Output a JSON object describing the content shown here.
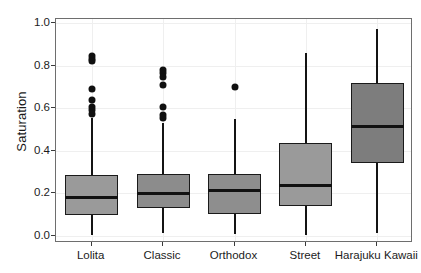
{
  "chart_data": {
    "type": "box",
    "title": "",
    "xlabel": "",
    "ylabel": "Saturation",
    "ylim": [
      0.0,
      1.0
    ],
    "grid": true,
    "legend": "none",
    "categories": [
      "Lolita",
      "Classic",
      "Orthodox",
      "Street",
      "Harajuku Kawaii"
    ],
    "ytick_labels": [
      "1.0",
      "0.8",
      "0.6",
      "0.4",
      "0.2",
      "0.0"
    ],
    "ytick_values": [
      1.0,
      0.8,
      0.6,
      0.4,
      0.2,
      0.0
    ],
    "boxes": [
      {
        "category": "Lolita",
        "whisker_low": 0.005,
        "q1": 0.1,
        "median": 0.18,
        "q3": 0.285,
        "whisker_high": 0.555,
        "fill": "#9a9a9a",
        "outliers": [
          0.845,
          0.83,
          0.82,
          0.69,
          0.64,
          0.605,
          0.59,
          0.575
        ]
      },
      {
        "category": "Classic",
        "whisker_low": 0.015,
        "q1": 0.13,
        "median": 0.2,
        "q3": 0.29,
        "whisker_high": 0.53,
        "fill": "#8c8c8c",
        "outliers": [
          0.78,
          0.765,
          0.745,
          0.71,
          0.605,
          0.57,
          0.555
        ]
      },
      {
        "category": "Orthodox",
        "whisker_low": 0.01,
        "q1": 0.105,
        "median": 0.215,
        "q3": 0.29,
        "whisker_high": 0.55,
        "fill": "#8e8e8e",
        "outliers": [
          0.7
        ]
      },
      {
        "category": "Street",
        "whisker_low": 0.005,
        "q1": 0.14,
        "median": 0.235,
        "q3": 0.435,
        "whisker_high": 0.86,
        "fill": "#9a9a9a",
        "outliers": []
      },
      {
        "category": "Harajuku Kawaii",
        "whisker_low": 0.015,
        "q1": 0.345,
        "median": 0.515,
        "q3": 0.72,
        "whisker_high": 0.97,
        "fill": "#7d7d7d",
        "outliers": []
      }
    ]
  },
  "colors": {
    "panel_border": "#6e6e6e",
    "gridline": "#efefef",
    "box_outline": "#1a1a1a",
    "median": "#111111",
    "outlier": "#101010",
    "text": "#1c1c1c",
    "background": "#ffffff"
  }
}
